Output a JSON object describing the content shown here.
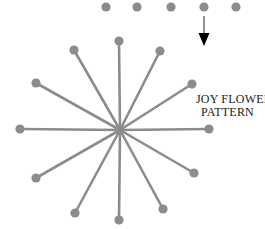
{
  "figure": {
    "background_color": "#ffffff",
    "width": 265,
    "height": 229
  },
  "caption": {
    "line1": "JOY FLOWER",
    "line2": "PATTERN",
    "color": "#1a1a1a",
    "full_text": "JOY FLOWER PATTERN"
  },
  "flower": {
    "name": "joy-flower-pattern",
    "center": {
      "x": 120,
      "y": 130
    },
    "spoke_count": 12,
    "spoke_color": "#8c8c8c",
    "spoke_width": 2.6,
    "tip_dot_color": "#8c8c8c",
    "tip_dot_radius": 4.6,
    "angle_step_degrees": 30,
    "spokes": [
      {
        "label": "spoke-n",
        "angle": 270,
        "tip": {
          "x": 119,
          "y": 41
        },
        "radius": 89
      },
      {
        "label": "spoke-nne",
        "angle": 300,
        "tip": {
          "x": 160,
          "y": 51
        },
        "radius": 88
      },
      {
        "label": "spoke-ene",
        "angle": 330,
        "tip": {
          "x": 192,
          "y": 84
        },
        "radius": 83
      },
      {
        "label": "spoke-e",
        "angle": 0,
        "tip": {
          "x": 209,
          "y": 129
        },
        "radius": 89
      },
      {
        "label": "spoke-ese",
        "angle": 30,
        "tip": {
          "x": 194,
          "y": 173
        },
        "radius": 85
      },
      {
        "label": "spoke-sse",
        "angle": 60,
        "tip": {
          "x": 163,
          "y": 209
        },
        "radius": 88
      },
      {
        "label": "spoke-s",
        "angle": 90,
        "tip": {
          "x": 119,
          "y": 220
        },
        "radius": 90
      },
      {
        "label": "spoke-ssw",
        "angle": 120,
        "tip": {
          "x": 75,
          "y": 213
        },
        "radius": 92
      },
      {
        "label": "spoke-wsw",
        "angle": 150,
        "tip": {
          "x": 36,
          "y": 178
        },
        "radius": 94
      },
      {
        "label": "spoke-w",
        "angle": 180,
        "tip": {
          "x": 20,
          "y": 129
        },
        "radius": 100
      },
      {
        "label": "spoke-wnw",
        "angle": 210,
        "tip": {
          "x": 36,
          "y": 83
        },
        "radius": 93
      },
      {
        "label": "spoke-nnw",
        "angle": 240,
        "tip": {
          "x": 74,
          "y": 50
        },
        "radius": 90
      }
    ]
  },
  "dot_row": {
    "name": "top-dot-row",
    "count": 5,
    "color": "#8c8c8c",
    "radius": 4.6,
    "y": 7,
    "dots": [
      {
        "label": "dot-1",
        "x": 106
      },
      {
        "label": "dot-2",
        "x": 137
      },
      {
        "label": "dot-3",
        "x": 171
      },
      {
        "label": "dot-4",
        "x": 204
      },
      {
        "label": "dot-5",
        "x": 236
      }
    ]
  },
  "arrow": {
    "name": "down-arrow",
    "direction": "down",
    "shaft_color": "#8f8f8f",
    "head_color": "#000000",
    "x": 204,
    "y_start": 16,
    "y_end": 46,
    "shaft_width": 2,
    "head_width": 11,
    "head_height": 13
  }
}
